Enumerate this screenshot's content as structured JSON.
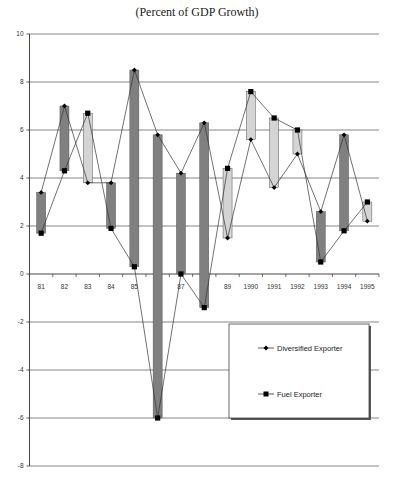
{
  "title": "(Percent of GDP Growth)",
  "colors": {
    "up_bar": "#808080",
    "down_bar": "#d4d4d4",
    "bar_stroke": "#555555",
    "line": "#333333",
    "grid": "#777777",
    "marker": "#000000"
  },
  "legend": {
    "items": [
      {
        "label": "Diversified Exporter",
        "marker": "diamond"
      },
      {
        "label": "Fuel Exporter",
        "marker": "square"
      }
    ]
  },
  "chart_data": {
    "type": "line",
    "subtype": "up-down bars between two series",
    "title": "(Percent of GDP Growth)",
    "xlabel": "",
    "ylabel": "",
    "categories": [
      "81",
      "82",
      "83",
      "84",
      "85",
      "86",
      "87",
      "88",
      "89",
      "1990",
      "1991",
      "1992",
      "1993",
      "1994",
      "1995"
    ],
    "series": [
      {
        "name": "Diversified Exporter",
        "marker": "diamond",
        "values": [
          3.4,
          7.0,
          3.8,
          3.8,
          8.5,
          5.8,
          4.2,
          6.3,
          1.5,
          5.6,
          3.6,
          5.0,
          2.6,
          5.8,
          2.2
        ]
      },
      {
        "name": "Fuel Exporter",
        "marker": "square",
        "values": [
          1.7,
          4.3,
          6.7,
          1.9,
          0.3,
          -6.0,
          0.0,
          -1.4,
          4.4,
          7.6,
          6.5,
          6.0,
          0.5,
          1.8,
          3.0
        ]
      }
    ],
    "ylim": [
      -8,
      10
    ],
    "yticks": [
      -8,
      -6,
      -4,
      -2,
      0,
      2,
      4,
      6,
      8,
      10
    ],
    "grid": true,
    "legend_position": "lower right, inside plot"
  }
}
